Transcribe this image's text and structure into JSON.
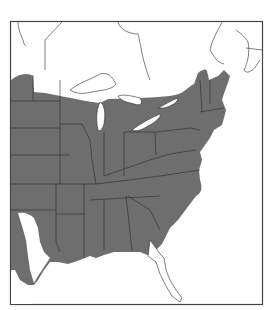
{
  "map": {
    "type": "species range map",
    "region": "Eastern United States and southeastern Canada",
    "legend": [],
    "colors": {
      "range_fill": "#6e6e6e",
      "land": "#ffffff",
      "water": "#ffffff",
      "borders": "#2a2a2a",
      "frame": "#444444"
    },
    "features": {
      "shaded_range": "Eastern US from the Great Plains to the Atlantic coast, north into southern Ontario/Quebec and New England",
      "unshaded": [
        "Canada north of the Great Lakes",
        "Peninsular Florida",
        "South Texas",
        "Great Lakes",
        "Atlantic Ocean",
        "Gulf of Mexico"
      ]
    }
  }
}
